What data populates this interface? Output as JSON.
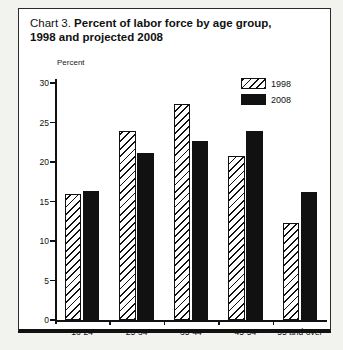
{
  "figure": {
    "title_prefix": "Chart 3. ",
    "title_line1_bold": "Percent of labor force by age group,",
    "title_line2_bold": "1998 and projected 2008"
  },
  "chart_data": {
    "type": "bar",
    "title": "Chart 3. Percent of labor force by age group, 1998 and projected 2008",
    "xlabel": "",
    "ylabel": "Percent",
    "ylim": [
      0,
      30
    ],
    "yticks": [
      0,
      5,
      10,
      15,
      20,
      25,
      30
    ],
    "ytick_labels": [
      "0",
      "5",
      "10",
      "15",
      "20",
      "25",
      "30"
    ],
    "grid": false,
    "legend_position": "top-right",
    "categories": [
      "16-24",
      "25-34",
      "35-44",
      "45-54",
      "55 and over"
    ],
    "series": [
      {
        "name": "1998",
        "values": [
          15.9,
          23.9,
          27.4,
          20.7,
          12.3
        ],
        "fill": "hatched",
        "color": "#111111"
      },
      {
        "name": "2008",
        "values": [
          16.3,
          21.1,
          22.6,
          23.9,
          16.2
        ],
        "fill": "solid",
        "color": "#111111"
      }
    ]
  },
  "legend": {
    "items": [
      {
        "label": "1998"
      },
      {
        "label": "2008"
      }
    ]
  }
}
